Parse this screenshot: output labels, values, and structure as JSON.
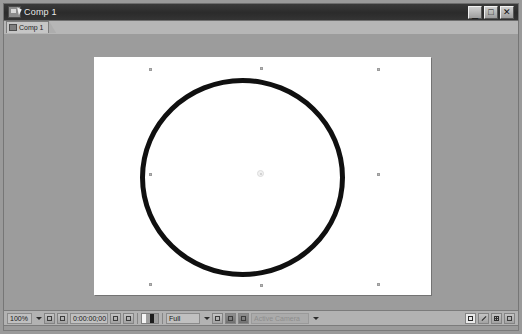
{
  "window": {
    "title": "Comp 1",
    "app_icon": "composition-icon",
    "controls": {
      "minimize": "_",
      "maximize": "□",
      "close": "✕"
    }
  },
  "tabs": [
    {
      "label": "Comp 1",
      "icon": "composition-icon",
      "active": true
    }
  ],
  "canvas": {
    "background_color": "#ffffff",
    "panel_color": "#9c9c9c",
    "shape": {
      "name": "ellipse-shape",
      "stroke_color": "#101010",
      "fill": "none"
    },
    "selection_handles": 8,
    "anchor_point": "anchor-point"
  },
  "toolbar": {
    "zoom_level": "100%",
    "timecode": "0:00:00;00",
    "resolution": "Full",
    "camera": "Active Camera",
    "region_of_interest": "roi-icon",
    "take_snapshot": "snapshot-icon",
    "show_snapshot": "show-snapshot-icon",
    "show_channel": "channel-icon",
    "toggle_mask": "mask-icon",
    "toggle_transparency_grid": "transparency-grid-icon",
    "three_d_view": "3d-view-icon",
    "fast_previews": "fast-previews-icon",
    "timeline_button": "timeline-icon",
    "comp_flowchart": "flowchart-icon",
    "reset_exposure": "exposure-icon",
    "adjust_exposure": "adjust-exposure-icon"
  }
}
